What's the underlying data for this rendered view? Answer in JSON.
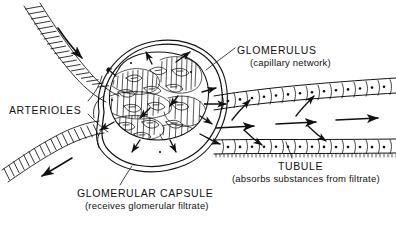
{
  "figure": {
    "kind": "anatomical-line-diagram",
    "background_color": "#ffffff",
    "ink_color": "#111111",
    "width": 396,
    "height": 232
  },
  "labels": {
    "arterioles": "ARTERIOLES",
    "glomerulus": "GLOMERULUS",
    "glomerulus_sub": "(capillary network)",
    "tubule": "TUBULE",
    "tubule_sub": "(absorbs substances from filtrate)",
    "capsule": "GLOMERULAR CAPSULE",
    "capsule_sub": "(receives glomerular filtrate)"
  },
  "structures": [
    {
      "name": "afferent-arteriole",
      "note": "enters from upper left, ladder hatching, inward flow arrow"
    },
    {
      "name": "efferent-arteriole",
      "note": "exits to lower left, ladder hatching, outward flow arrow"
    },
    {
      "name": "glomerular-capillary-tangle",
      "note": "dense coiled capillary loops with leaf shapes"
    },
    {
      "name": "glomerular-capsule",
      "note": "double outline enclosing the glomerulus"
    },
    {
      "name": "tubule",
      "note": "two rows of epithelial cells with nuclei extending right"
    },
    {
      "name": "flow-arrows",
      "note": "arrows indicating blood flow, filtration and absorption"
    }
  ]
}
